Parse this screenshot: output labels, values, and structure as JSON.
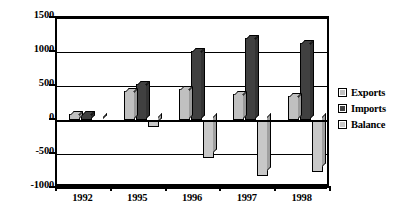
{
  "chart_data": {
    "type": "bar",
    "title": "",
    "subtitle": "",
    "xlabel": "",
    "ylabel": "",
    "categories": [
      "1992",
      "1995",
      "1996",
      "1997",
      "1998"
    ],
    "series": [
      {
        "name": "Exports",
        "color": "#c0c0c0",
        "values": [
          85,
          420,
          450,
          380,
          360
        ]
      },
      {
        "name": "Imports",
        "color": "#404040",
        "values": [
          95,
          530,
          1010,
          1200,
          1130
        ]
      },
      {
        "name": "Balance",
        "color": "#c8c8c8",
        "values": [
          -10,
          -110,
          -560,
          -820,
          -770
        ]
      }
    ],
    "ylim": [
      -1000,
      1500
    ],
    "yticks": [
      1500,
      1000,
      500,
      0,
      -500,
      -1000
    ],
    "ytick_labels": [
      "1500",
      "1000",
      "500",
      "0",
      "-500",
      "-1000"
    ],
    "grid": true,
    "grid_axis": "y",
    "legend": true,
    "legend_position": "right",
    "legend_entries": [
      "Exports",
      "Imports",
      "Balance"
    ],
    "bar_style": "3d-column",
    "plot_background": "#ffffff",
    "axis_color": "#000000"
  }
}
